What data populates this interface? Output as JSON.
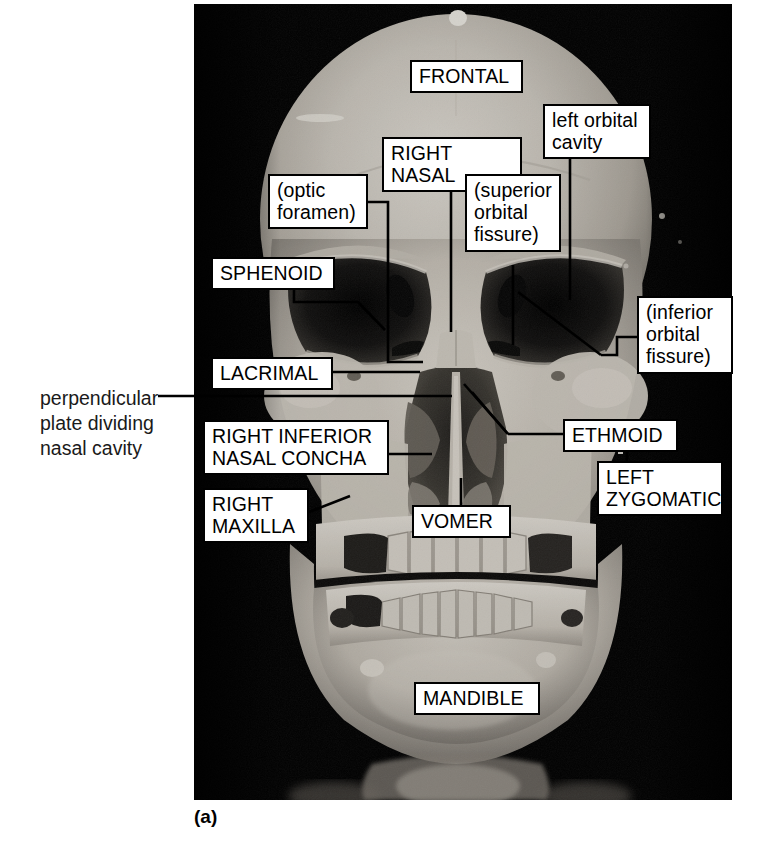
{
  "figure": {
    "caption": "(a)",
    "photo": {
      "background_color": "#000000",
      "bone_color": "#d8d4cc",
      "shadow_color": "#3a3833"
    }
  },
  "labels": [
    {
      "id": "frontal",
      "text": "FRONTAL",
      "style": "caps",
      "boxed": true,
      "x": 410,
      "y": 60,
      "w": 113,
      "h": 31
    },
    {
      "id": "right-nasal",
      "text": "RIGHT NASAL",
      "style": "caps",
      "boxed": true,
      "x": 382,
      "y": 137,
      "w": 140,
      "h": 31
    },
    {
      "id": "left-orbital-cavity",
      "text": "left orbital\ncavity",
      "style": "lower",
      "boxed": true,
      "x": 543,
      "y": 104,
      "w": 108,
      "h": 50
    },
    {
      "id": "optic-foramen",
      "text": "(optic\nforamen)",
      "style": "lower",
      "boxed": true,
      "x": 268,
      "y": 174,
      "w": 100,
      "h": 54
    },
    {
      "id": "superior-orbital-fissure",
      "text": "(superior\norbital\nfissure)",
      "style": "lower",
      "boxed": true,
      "x": 465,
      "y": 174,
      "w": 96,
      "h": 91
    },
    {
      "id": "sphenoid",
      "text": "SPHENOID",
      "style": "caps",
      "boxed": true,
      "x": 211,
      "y": 257,
      "w": 124,
      "h": 31
    },
    {
      "id": "inferior-orbital-fissure",
      "text": "(inferior\norbital\nfissure)",
      "style": "lower",
      "boxed": true,
      "x": 637,
      "y": 296,
      "w": 96,
      "h": 81
    },
    {
      "id": "lacrimal",
      "text": "LACRIMAL",
      "style": "caps",
      "boxed": true,
      "x": 211,
      "y": 357,
      "w": 122,
      "h": 31
    },
    {
      "id": "perpendicular-plate",
      "text": "perpendicular\nplate dividing\nnasal cavity",
      "style": "plain",
      "boxed": false,
      "x": 40,
      "y": 386,
      "w": 160,
      "h": 78
    },
    {
      "id": "right-inferior-nasal-concha",
      "text": "RIGHT INFERIOR\nNASAL CONCHA",
      "style": "caps",
      "boxed": true,
      "x": 203,
      "y": 420,
      "w": 186,
      "h": 54
    },
    {
      "id": "ethmoid",
      "text": "ETHMOID",
      "style": "caps",
      "boxed": true,
      "x": 563,
      "y": 419,
      "w": 115,
      "h": 31
    },
    {
      "id": "left-zygomatic",
      "text": "LEFT\nZYGOMATIC",
      "style": "caps",
      "boxed": true,
      "x": 597,
      "y": 461,
      "w": 126,
      "h": 57
    },
    {
      "id": "right-maxilla",
      "text": "RIGHT\nMAXILLA",
      "style": "caps",
      "boxed": true,
      "x": 203,
      "y": 488,
      "w": 106,
      "h": 54
    },
    {
      "id": "vomer",
      "text": "VOMER",
      "style": "caps",
      "boxed": true,
      "x": 412,
      "y": 505,
      "w": 99,
      "h": 31
    },
    {
      "id": "mandible",
      "text": "MANDIBLE",
      "style": "caps",
      "boxed": true,
      "x": 414,
      "y": 682,
      "w": 126,
      "h": 31
    }
  ],
  "leader_lines": [
    {
      "id": "right-nasal-leader",
      "points": "451,168 451,332"
    },
    {
      "id": "left-orbital-cavity-leader",
      "points": "570,154 570,300"
    },
    {
      "id": "optic-foramen-leader",
      "points": "368,202 388,202 388,362 423,362"
    },
    {
      "id": "sphenoid-leader",
      "points": "294,288 294,302 358,302 385,330"
    },
    {
      "id": "superior-orbital-fissure-leader",
      "points": "513,265 513,345"
    },
    {
      "id": "inferior-orbital-fissure-leader",
      "points": "637,337 617,337 617,355 601,355"
    },
    {
      "id": "inferior-orbital-fissure-diag",
      "points": "601,355 518,292"
    },
    {
      "id": "lacrimal-leader",
      "points": "333,372 420,372"
    },
    {
      "id": "perpendicular-plate-leader",
      "points": "158,396 452,396"
    },
    {
      "id": "concha-leader",
      "points": "389,454 432,454"
    },
    {
      "id": "ethmoid-leader",
      "points": "563,434 508,434"
    },
    {
      "id": "ethmoid-diag-upper",
      "points": "508,434 464,384"
    },
    {
      "id": "ethmoid-diag-lower",
      "points": "508,434 472,392"
    },
    {
      "id": "right-maxilla-leader",
      "points": "309,512 350,496"
    },
    {
      "id": "vomer-leader",
      "points": "461,505 461,478"
    },
    {
      "id": "left-zygomatic-leader",
      "points": "627,461 627,438"
    }
  ],
  "colors": {
    "label_border": "#000000",
    "label_fill": "#ffffff",
    "label_text": "#000000",
    "leader_stroke": "#000000",
    "page_background": "#ffffff",
    "photo_background": "#000000"
  }
}
